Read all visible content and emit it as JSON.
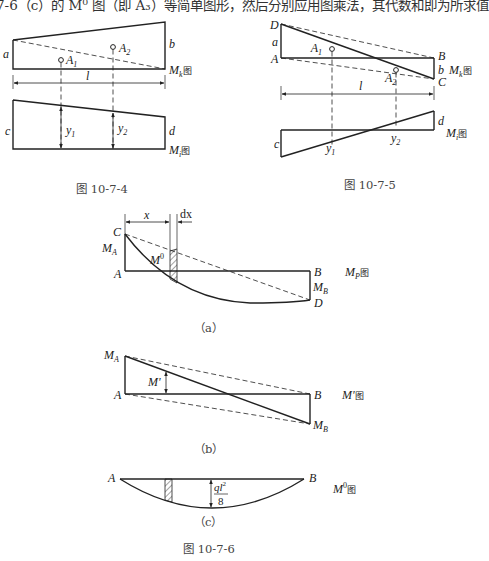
{
  "header_text": "7-6（c）的 M⁰ 图（即 A₃）等简单图形，然后分别应用图乘法，其代数和即为所求值",
  "fig_10_7_4": {
    "caption": "图 10-7-4",
    "top": {
      "label_a": "a",
      "label_b": "b",
      "A1": "A",
      "A1_sub": "1",
      "A2": "A",
      "A2_sub": "2",
      "diagram_label_M": "M",
      "diagram_label_sub": "k",
      "diagram_label_suffix": "图",
      "span": "l"
    },
    "bottom": {
      "label_c": "c",
      "label_d": "d",
      "y1": "y",
      "y1_sub": "1",
      "y2": "y",
      "y2_sub": "2",
      "diagram_label_M": "M",
      "diagram_label_sub": "i",
      "diagram_label_suffix": "图"
    }
  },
  "fig_10_7_5": {
    "caption": "图 10-7-5",
    "top": {
      "D": "D",
      "A": "A",
      "B": "B",
      "C": "C",
      "label_a": "a",
      "label_b": "b",
      "A1": "A",
      "A1_sub": "1",
      "A2": "A",
      "A2_sub": "2",
      "diagram_label_M": "M",
      "diagram_label_sub": "k",
      "diagram_label_suffix": "图",
      "span": "l"
    },
    "bottom": {
      "label_c": "c",
      "label_d": "d",
      "y1": "y",
      "y1_sub": "1",
      "y2": "y",
      "y2_sub": "2",
      "diagram_label_M": "M",
      "diagram_label_sub": "i",
      "diagram_label_suffix": "图"
    }
  },
  "fig_10_7_6": {
    "caption": "图 10-7-6",
    "a": {
      "sub_caption": "（a）",
      "C": "C",
      "A": "A",
      "B": "B",
      "D": "D",
      "MA": "M",
      "MA_sub": "A",
      "MB": "M",
      "MB_sub": "B",
      "M0": "M",
      "M0_sup": "0",
      "x": "x",
      "dx": "dx",
      "diagram_label_M": "M",
      "diagram_label_sub": "P",
      "diagram_label_suffix": "图"
    },
    "b": {
      "sub_caption": "（b）",
      "MA": "M",
      "MA_sub": "A",
      "A": "A",
      "B": "B",
      "MB": "M",
      "MB_sub": "B",
      "Mprime": "M'",
      "diagram_label": "M'",
      "diagram_label_suffix": "图"
    },
    "c": {
      "sub_caption": "（c）",
      "A": "A",
      "B": "B",
      "ql2_num": "ql",
      "ql2_sup": "2",
      "ql2_den": "8",
      "diagram_label_M": "M",
      "diagram_label_sup": "0",
      "diagram_label_suffix": "图"
    }
  }
}
